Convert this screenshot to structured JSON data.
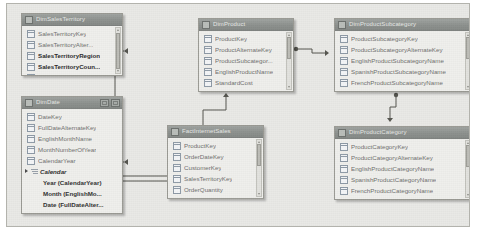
{
  "app": {
    "view_name": "Model Diagram View",
    "canvas_background": "#e9e9e6",
    "canvas_border": "#b3b3ad",
    "table_header_color": "#8d918e",
    "table_body_color": "#efefec",
    "relationship_line_color": "#55554f"
  },
  "tables": [
    {
      "id": "dim-sales-territory",
      "title": "DimSalesTerritory",
      "x": 14,
      "y": 9,
      "w": 102,
      "h": 63,
      "has_window_buttons": false,
      "scrollbar": {
        "visible": true,
        "thumb_top": 5,
        "thumb_height": 36
      },
      "fields": [
        {
          "label": "SalesTerritoryKey",
          "emphasis": "dim"
        },
        {
          "label": "SalesTerritoryAlter...",
          "emphasis": "dim"
        },
        {
          "label": "SalesTerritoryRegion",
          "emphasis": "bold"
        },
        {
          "label": "SalesTerritoryCoun...",
          "emphasis": "bold"
        },
        {
          "label": "SalesTerritoryGroup",
          "emphasis": "bold"
        }
      ],
      "hierarchies": []
    },
    {
      "id": "dim-date",
      "title": "DimDate",
      "x": 14,
      "y": 92,
      "w": 102,
      "h": 118,
      "has_window_buttons": true,
      "window_buttons": [
        "restore-button",
        "maximize-button"
      ],
      "scrollbar": {
        "visible": false,
        "thumb_top": 0,
        "thumb_height": 0
      },
      "fields": [
        {
          "label": "DateKey",
          "emphasis": "dim"
        },
        {
          "label": "FullDateAlternateKey",
          "emphasis": "dim"
        },
        {
          "label": "EnglishMonthName",
          "emphasis": "dim"
        },
        {
          "label": "MonthNumberOfYear",
          "emphasis": "dim"
        },
        {
          "label": "CalendarYear",
          "emphasis": "dim"
        }
      ],
      "hierarchies": [
        {
          "name": "Calendar",
          "levels": [
            "Year (CalendarYear)",
            "Month (EnglishMo...",
            "Date (FullDateAlter..."
          ]
        }
      ]
    },
    {
      "id": "dim-product",
      "title": "DimProduct",
      "x": 191,
      "y": 14,
      "w": 96,
      "h": 74,
      "has_window_buttons": false,
      "scrollbar": {
        "visible": true,
        "thumb_top": 4,
        "thumb_height": 22
      },
      "fields": [
        {
          "label": "ProductKey",
          "emphasis": "dim"
        },
        {
          "label": "ProductAlternateKey",
          "emphasis": "dim"
        },
        {
          "label": "ProductSubcategor...",
          "emphasis": "dim"
        },
        {
          "label": "EnglishProductName",
          "emphasis": "dim"
        },
        {
          "label": "StandardCost",
          "emphasis": "dim"
        }
      ],
      "hierarchies": []
    },
    {
      "id": "dim-product-subcategory",
      "title": "DimProductSubcategory",
      "x": 327,
      "y": 14,
      "w": 139,
      "h": 74,
      "has_window_buttons": false,
      "scrollbar": {
        "visible": true,
        "thumb_top": 4,
        "thumb_height": 22
      },
      "fields": [
        {
          "label": "ProductSubcategoryKey",
          "emphasis": "dim"
        },
        {
          "label": "ProductSubcategoryAlternateKey",
          "emphasis": "dim"
        },
        {
          "label": "EnglishProductSubcategoryName",
          "emphasis": "dim"
        },
        {
          "label": "SpanishProductSubcategoryName",
          "emphasis": "dim"
        },
        {
          "label": "FrenchProductSubcategoryName",
          "emphasis": "dim"
        }
      ],
      "hierarchies": []
    },
    {
      "id": "dim-product-category",
      "title": "DimProductCategory",
      "x": 327,
      "y": 122,
      "w": 139,
      "h": 74,
      "has_window_buttons": false,
      "scrollbar": {
        "visible": true,
        "thumb_top": 4,
        "thumb_height": 22
      },
      "fields": [
        {
          "label": "ProductCategoryKey",
          "emphasis": "dim"
        },
        {
          "label": "ProductCategoryAlternateKey",
          "emphasis": "dim"
        },
        {
          "label": "EnglishProductCategoryName",
          "emphasis": "dim"
        },
        {
          "label": "SpanishProductCategoryName",
          "emphasis": "dim"
        },
        {
          "label": "FrenchProductCategoryName",
          "emphasis": "dim"
        }
      ],
      "hierarchies": []
    },
    {
      "id": "fact-internet-sales",
      "title": "FactInternetSales",
      "x": 160,
      "y": 121,
      "w": 97,
      "h": 74,
      "has_window_buttons": false,
      "scrollbar": {
        "visible": true,
        "thumb_top": 4,
        "thumb_height": 22
      },
      "fields": [
        {
          "label": "ProductKey",
          "emphasis": "dim"
        },
        {
          "label": "OrderDateKey",
          "emphasis": "dim"
        },
        {
          "label": "CustomerKey",
          "emphasis": "dim"
        },
        {
          "label": "SalesTerritoryKey",
          "emphasis": "dim"
        },
        {
          "label": "OrderQuantity",
          "emphasis": "dim"
        }
      ],
      "hierarchies": []
    }
  ],
  "relationships": [
    {
      "id": "rel-fact-to-salesterritory",
      "from_table": "FactInternetSales",
      "to_table": "DimSalesTerritory",
      "from_column": "SalesTerritoryKey",
      "to_column": "SalesTerritoryKey",
      "path": "M 183,172 L 108,172 L 108,47 L 117,47",
      "arrow": {
        "x": 117,
        "y": 47,
        "dir": "left"
      },
      "dot": {
        "x": 183,
        "y": 172
      }
    },
    {
      "id": "rel-fact-to-date",
      "from_table": "FactInternetSales",
      "to_table": "DimDate",
      "from_column": "OrderDateKey",
      "to_column": "DateKey",
      "path": "M 183,177 L 101,177 L 101,158 L 117,158",
      "arrow": {
        "x": 117,
        "y": 158,
        "dir": "left"
      },
      "dot": {
        "x": 183,
        "y": 177
      }
    },
    {
      "id": "rel-fact-to-product",
      "from_table": "FactInternetSales",
      "to_table": "DimProduct",
      "from_column": "ProductKey",
      "to_column": "ProductKey",
      "path": "M 196,136 L 196,106 L 219,106 L 219,93",
      "arrow": {
        "x": 219,
        "y": 89,
        "dir": "up"
      },
      "dot": {
        "x": 196,
        "y": 136
      }
    },
    {
      "id": "rel-product-to-subcategory",
      "from_table": "DimProduct",
      "to_table": "DimProductSubcategory",
      "from_column": "ProductSubcategoryKey",
      "to_column": "ProductSubcategoryKey",
      "path": "M 289,45 L 305,45 L 305,49 L 318,49",
      "arrow": {
        "x": 322,
        "y": 49,
        "dir": "right"
      },
      "dot": {
        "x": 289,
        "y": 45
      }
    },
    {
      "id": "rel-subcategory-to-category",
      "from_table": "DimProductSubcategory",
      "to_table": "DimProductCategory",
      "from_column": "ProductCategoryKey",
      "to_column": "ProductCategoryKey",
      "path": "M 389,91 L 389,103 L 383,103 L 383,114",
      "arrow": {
        "x": 383,
        "y": 118,
        "dir": "down"
      },
      "dot": {
        "x": 389,
        "y": 91
      }
    }
  ]
}
